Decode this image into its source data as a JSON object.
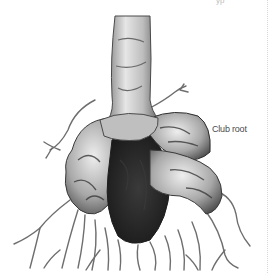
{
  "illustration": {
    "subject": "club-root-diseased-root",
    "label": "Club root",
    "top_cut_text": "yp",
    "colors": {
      "background": "#ffffff",
      "ink_dark": "#1e1e1e",
      "ink_mid": "#7a7a7a",
      "ink_light": "#cfcfcf",
      "label_text": "#4a4a4a"
    }
  }
}
